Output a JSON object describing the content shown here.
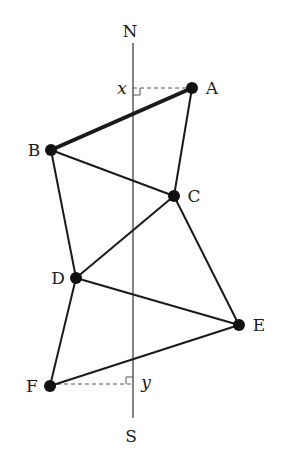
{
  "axis": {
    "north_label": "N",
    "south_label": "S",
    "x": 133,
    "y_top": 43,
    "y_bottom": 418
  },
  "points": [
    {
      "id": "A",
      "label": "A",
      "x": 192,
      "y": 88
    },
    {
      "id": "B",
      "label": "B",
      "x": 51,
      "y": 150
    },
    {
      "id": "C",
      "label": "C",
      "x": 174,
      "y": 196
    },
    {
      "id": "D",
      "label": "D",
      "x": 76,
      "y": 278
    },
    {
      "id": "E",
      "label": "E",
      "x": 239,
      "y": 325
    },
    {
      "id": "F",
      "label": "F",
      "x": 50,
      "y": 386
    }
  ],
  "edges": [
    {
      "from": "A",
      "to": "B",
      "bold": true
    },
    {
      "from": "A",
      "to": "C",
      "bold": false
    },
    {
      "from": "B",
      "to": "C",
      "bold": false
    },
    {
      "from": "B",
      "to": "D",
      "bold": false
    },
    {
      "from": "C",
      "to": "D",
      "bold": false
    },
    {
      "from": "C",
      "to": "E",
      "bold": false
    },
    {
      "from": "D",
      "to": "E",
      "bold": false
    },
    {
      "from": "D",
      "to": "F",
      "bold": false
    },
    {
      "from": "E",
      "to": "F",
      "bold": false
    }
  ],
  "projections": [
    {
      "point": "A",
      "label": "x",
      "y": 88
    },
    {
      "point": "F",
      "label": "y",
      "y": 386
    }
  ],
  "colors": {
    "ink": "#1a1a1a",
    "axis": "#333333",
    "dash": "#555555"
  }
}
